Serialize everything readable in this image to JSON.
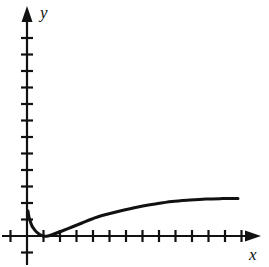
{
  "figure": {
    "kind": "cartesian-graph",
    "background_color": "#ffffff",
    "stroke_color": "#111111",
    "width": 269,
    "height": 267
  },
  "axes": {
    "x_axis": {
      "label": "x",
      "origin_px": 27,
      "baseline_px": 236,
      "arrow": "right",
      "tick_spacing_px": 16.5,
      "tick_half_len_px": 6,
      "tick_count_right": 13,
      "tick_count_left": 1,
      "labels_shown": false
    },
    "y_axis": {
      "label": "y",
      "origin_px": 236,
      "baseline_px": 27,
      "arrow": "up",
      "tick_spacing_px": 16.5,
      "tick_half_len_px": 6,
      "tick_count_up": 12,
      "tick_count_down": 1,
      "labels_shown": false
    }
  },
  "chart_data": {
    "type": "line",
    "title": "",
    "xlabel": "x",
    "ylabel": "y",
    "xlim": [
      -1,
      13
    ],
    "ylim": [
      -1,
      12
    ],
    "grid": false,
    "legend": false,
    "tick_labels_shown": false,
    "series": [
      {
        "name": "curve",
        "stroke_color": "#111111",
        "stroke_width_px": 3,
        "x": [
          0.05,
          0.1,
          0.2,
          0.3,
          0.4,
          0.5,
          0.7,
          1.0,
          1.3,
          1.6,
          2.0,
          2.5,
          3.0,
          3.5,
          4.0,
          5.0,
          6.0,
          7.0,
          8.0,
          9.0,
          10.0,
          11.0,
          12.0,
          12.8
        ],
        "y": [
          1.55,
          1.1,
          0.62,
          0.36,
          0.2,
          0.1,
          0.0,
          0.0,
          0.1,
          0.25,
          0.5,
          0.82,
          1.1,
          1.35,
          1.55,
          1.92,
          2.2,
          2.42,
          2.6,
          2.76,
          2.9,
          3.02,
          3.14,
          3.2
        ],
        "points_px": [
          [
            28,
            211
          ],
          [
            29,
            217
          ],
          [
            30.5,
            222
          ],
          [
            32,
            226
          ],
          [
            34,
            229
          ],
          [
            36,
            231.5
          ],
          [
            39,
            234
          ],
          [
            43,
            236
          ],
          [
            48,
            236
          ],
          [
            54,
            234
          ],
          [
            62,
            231
          ],
          [
            72,
            227
          ],
          [
            82,
            223
          ],
          [
            92,
            219
          ],
          [
            102,
            215.5
          ],
          [
            120,
            211
          ],
          [
            138,
            207
          ],
          [
            155,
            204
          ],
          [
            172,
            201.5
          ],
          [
            190,
            200
          ],
          [
            206,
            199
          ],
          [
            222,
            198.6
          ],
          [
            234,
            198.5
          ],
          [
            238,
            198.5
          ]
        ]
      }
    ],
    "annotations": [
      {
        "text": "minimum touches the x-axis",
        "x_px": 43,
        "y_px": 236,
        "visible": false
      }
    ]
  }
}
